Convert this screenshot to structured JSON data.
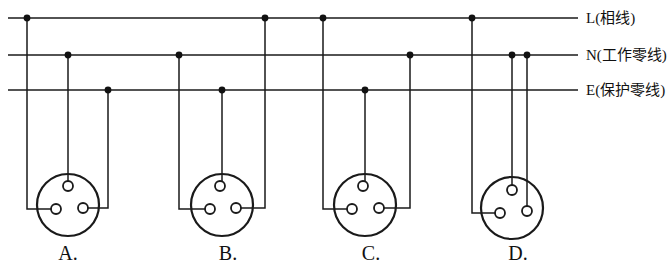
{
  "figure": {
    "canvas": {
      "width": 672,
      "height": 271
    },
    "line_color": "#1a1a1a",
    "background": "#ffffff"
  },
  "bus_lines": [
    {
      "id": "L",
      "label": "L(相线)",
      "y": 18,
      "x_start": 8,
      "x_end": 578,
      "label_x": 586,
      "label_y": 11
    },
    {
      "id": "N",
      "label": "N(工作零线)",
      "y": 55,
      "x_start": 8,
      "x_end": 578,
      "label_x": 586,
      "label_y": 48
    },
    {
      "id": "E",
      "label": "E(保护零线)",
      "y": 90,
      "x_start": 8,
      "x_end": 578,
      "label_x": 586,
      "label_y": 83
    }
  ],
  "outlets": [
    {
      "id": "A",
      "label": "A.",
      "label_x": 48,
      "label_y": 243,
      "center_x": 68,
      "center_y": 205,
      "radius": 31,
      "holes": [
        {
          "id": "top",
          "cx": 68,
          "cy": 186,
          "r": 5
        },
        {
          "id": "bottom-left",
          "cx": 56,
          "cy": 209,
          "r": 5
        },
        {
          "id": "bottom-right",
          "cx": 83,
          "cy": 208,
          "r": 5
        }
      ],
      "connections": [
        {
          "from_bus": "L",
          "to_hole": "bottom-left",
          "drop_x": 27,
          "turn_y": 209,
          "style": "side"
        },
        {
          "from_bus": "N",
          "to_hole": "top",
          "drop_x": 68,
          "turn_y": 186,
          "style": "straight"
        },
        {
          "from_bus": "E",
          "to_hole": "bottom-right",
          "drop_x": 108,
          "turn_y": 208,
          "style": "side"
        }
      ]
    },
    {
      "id": "B",
      "label": "B.",
      "label_x": 208,
      "label_y": 243,
      "center_x": 222,
      "center_y": 205,
      "radius": 31,
      "holes": [
        {
          "id": "top",
          "cx": 220,
          "cy": 186,
          "r": 5
        },
        {
          "id": "bottom-left",
          "cx": 210,
          "cy": 209,
          "r": 5
        },
        {
          "id": "bottom-right",
          "cx": 236,
          "cy": 208,
          "r": 5
        }
      ],
      "connections": [
        {
          "from_bus": "N",
          "to_hole": "bottom-left",
          "drop_x": 179,
          "turn_y": 209,
          "style": "side"
        },
        {
          "from_bus": "E",
          "to_hole": "top",
          "drop_x": 222,
          "turn_y": 186,
          "style": "straight"
        },
        {
          "from_bus": "L",
          "to_hole": "bottom-right",
          "drop_x": 265,
          "turn_y": 208,
          "style": "side"
        }
      ]
    },
    {
      "id": "C",
      "label": "C.",
      "label_x": 351,
      "label_y": 243,
      "center_x": 365,
      "center_y": 205,
      "radius": 31,
      "holes": [
        {
          "id": "top",
          "cx": 363,
          "cy": 186,
          "r": 5
        },
        {
          "id": "bottom-left",
          "cx": 352,
          "cy": 209,
          "r": 5
        },
        {
          "id": "bottom-right",
          "cx": 379,
          "cy": 208,
          "r": 5
        }
      ],
      "connections": [
        {
          "from_bus": "L",
          "to_hole": "bottom-left",
          "drop_x": 323,
          "turn_y": 209,
          "style": "side"
        },
        {
          "from_bus": "E",
          "to_hole": "top",
          "drop_x": 365,
          "turn_y": 186,
          "style": "straight"
        },
        {
          "from_bus": "N",
          "to_hole": "bottom-right",
          "drop_x": 410,
          "turn_y": 208,
          "style": "side"
        }
      ]
    },
    {
      "id": "D",
      "label": "D.",
      "label_x": 498,
      "label_y": 243,
      "center_x": 512,
      "center_y": 208,
      "radius": 31,
      "holes": [
        {
          "id": "top",
          "cx": 512,
          "cy": 190,
          "r": 5
        },
        {
          "id": "bottom-left",
          "cx": 500,
          "cy": 213,
          "r": 5
        },
        {
          "id": "bottom-right",
          "cx": 527,
          "cy": 211,
          "r": 5
        }
      ],
      "connections": [
        {
          "from_bus": "L",
          "to_hole": "bottom-left",
          "drop_x": 472,
          "turn_y": 213,
          "style": "side"
        },
        {
          "from_bus": "N",
          "to_hole": "top",
          "drop_x": 512,
          "turn_y": 190,
          "style": "straight"
        },
        {
          "from_bus": "N",
          "to_hole": "bottom-right",
          "drop_x": 527,
          "turn_y": 211,
          "style": "straight"
        }
      ]
    }
  ],
  "junction_dots": [
    {
      "bus": "L",
      "x": 27,
      "y": 18
    },
    {
      "bus": "N",
      "x": 68,
      "y": 55
    },
    {
      "bus": "E",
      "x": 108,
      "y": 90
    },
    {
      "bus": "N",
      "x": 179,
      "y": 55
    },
    {
      "bus": "E",
      "x": 222,
      "y": 90
    },
    {
      "bus": "L",
      "x": 265,
      "y": 18
    },
    {
      "bus": "L",
      "x": 323,
      "y": 18
    },
    {
      "bus": "E",
      "x": 365,
      "y": 90
    },
    {
      "bus": "N",
      "x": 410,
      "y": 55
    },
    {
      "bus": "L",
      "x": 472,
      "y": 18
    },
    {
      "bus": "N",
      "x": 512,
      "y": 55
    },
    {
      "bus": "N",
      "x": 527,
      "y": 55
    }
  ]
}
